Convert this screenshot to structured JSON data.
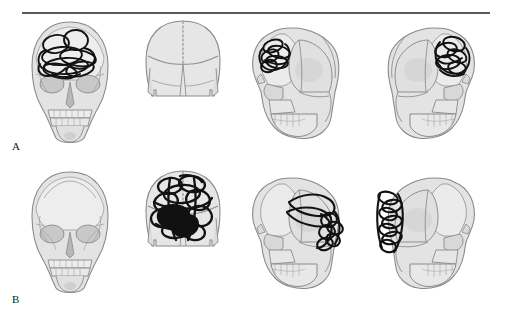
{
  "figure": {
    "type": "anatomical-illustration",
    "background_color": "#ffffff",
    "rule_color": "#5a5a5a",
    "bone_fill": "#e3e3e3",
    "bone_fill_dark": "#d2d2d2",
    "bone_fill_light": "#ededed",
    "suture_color": "#8f8f8f",
    "outline_color": "#8a8a8a",
    "marking_color": "#111111"
  },
  "panels": [
    {
      "id": "A",
      "label": "A",
      "views": [
        {
          "id": "a-frontal",
          "name": "frontal-view",
          "marked": true,
          "marking_region": "frontal-bone",
          "marking_style": "open-loops"
        },
        {
          "id": "a-vertex",
          "name": "vertex-view",
          "marked": false,
          "marking_region": "",
          "marking_style": "none"
        },
        {
          "id": "a-lateral-left",
          "name": "lateral-left-view",
          "marked": true,
          "marking_region": "frontal-supraorbital",
          "marking_style": "open-loops"
        },
        {
          "id": "a-lateral-right",
          "name": "lateral-right-view",
          "marked": true,
          "marking_region": "frontal-supraorbital",
          "marking_style": "open-loops"
        }
      ]
    },
    {
      "id": "B",
      "label": "B",
      "views": [
        {
          "id": "b-frontal",
          "name": "frontal-view",
          "marked": false,
          "marking_region": "",
          "marking_style": "none"
        },
        {
          "id": "b-vertex",
          "name": "vertex-view",
          "marked": true,
          "marking_region": "parietal-sagittal",
          "marking_style": "dense-loops-filled"
        },
        {
          "id": "b-lateral-left",
          "name": "lateral-left-view",
          "marked": true,
          "marking_region": "parietal-occipital",
          "marking_style": "elongated-loops"
        },
        {
          "id": "b-lateral-right",
          "name": "lateral-right-view",
          "marked": true,
          "marking_region": "occipital",
          "marking_style": "stacked-loops"
        }
      ]
    }
  ]
}
